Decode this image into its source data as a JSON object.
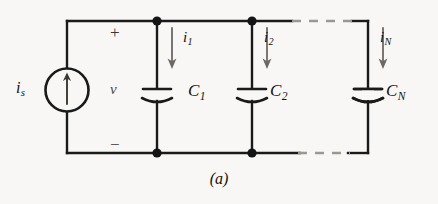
{
  "figure": {
    "caption": "(a)",
    "background_color": "#f8f7f5",
    "line_color": "#1a1a1a",
    "label_color": "#15120f"
  },
  "source": {
    "name": "independent current source",
    "label": "i",
    "subscript": "s",
    "arrow_direction": "up",
    "symbol": "circle-with-arrow"
  },
  "voltage": {
    "label": "v",
    "plus_sign": "+",
    "minus_sign": "−"
  },
  "branches": [
    {
      "current_label": "i",
      "current_subscript": "1",
      "current_direction": "down",
      "component_label": "C",
      "component_subscript": "1",
      "component_type": "capacitor"
    },
    {
      "current_label": "i",
      "current_subscript": "2",
      "current_direction": "down",
      "component_label": "C",
      "component_subscript": "2",
      "component_type": "capacitor"
    },
    {
      "current_label": "i",
      "current_subscript": "N",
      "current_direction": "down",
      "component_label": "C",
      "component_subscript": "N",
      "component_type": "capacitor"
    }
  ],
  "continuation": {
    "style": "dashed",
    "meaning": "additional capacitors omitted"
  },
  "nodes": {
    "count": 4,
    "style": "filled-dot"
  }
}
